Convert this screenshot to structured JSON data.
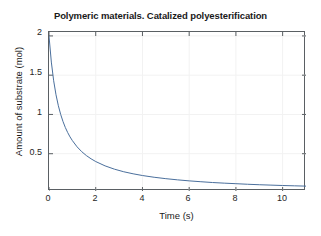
{
  "figure": {
    "background_color": "#ffffff",
    "axes_color": "#5a5f63",
    "grid_color": "#f2f2f2",
    "line_color": "#4a6f9c"
  },
  "chart_data": {
    "type": "line",
    "title": "Polymeric materials. Catalized polyesterification",
    "xlabel": "Time (s)",
    "ylabel": "Amount of substrate (mol)",
    "xlim": [
      0,
      11
    ],
    "ylim": [
      0.025,
      2.05
    ],
    "grid": true,
    "legend": null,
    "xticks": [
      0,
      2,
      4,
      6,
      8,
      10
    ],
    "xtick_labels": [
      "0",
      "2",
      "4",
      "6",
      "8",
      "10"
    ],
    "yticks": [
      0.5,
      1,
      1.5,
      2
    ],
    "ytick_labels": [
      "0.5",
      "1",
      "1.5",
      "2"
    ],
    "series": [
      {
        "name": "Amount of substrate",
        "color": "#4a6f9c",
        "x": [
          0,
          0.1,
          0.2,
          0.3,
          0.4,
          0.5,
          0.6,
          0.7,
          0.8,
          0.9,
          1,
          1.2,
          1.4,
          1.6,
          1.8,
          2,
          2.4,
          2.8,
          3.2,
          3.6,
          4,
          4.5,
          5,
          5.5,
          6,
          6.5,
          7,
          7.5,
          8,
          8.5,
          9,
          9.5,
          10,
          10.5,
          11
        ],
        "y": [
          2,
          1.667,
          1.429,
          1.25,
          1.111,
          1,
          0.909,
          0.833,
          0.769,
          0.714,
          0.667,
          0.588,
          0.526,
          0.476,
          0.435,
          0.4,
          0.345,
          0.303,
          0.27,
          0.244,
          0.222,
          0.2,
          0.182,
          0.167,
          0.154,
          0.143,
          0.133,
          0.125,
          0.118,
          0.111,
          0.105,
          0.1,
          0.095,
          0.091,
          0.087
        ]
      }
    ]
  }
}
